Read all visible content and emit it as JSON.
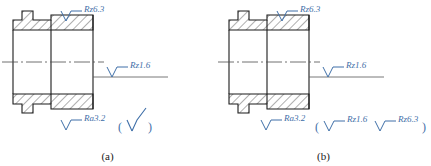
{
  "figures": [
    {
      "caption": "(a)",
      "symbols": {
        "top": "Rz6.3",
        "middle": "Rz1.6",
        "bottom_left": "Ra3.2"
      },
      "paren_group": {
        "open": "(",
        "close": ")",
        "entries": [
          ""
        ]
      }
    },
    {
      "caption": "(b)",
      "symbols": {
        "top": "Rz6.3",
        "middle": "Rz1.6",
        "bottom_left": "Ra3.2"
      },
      "paren_group": {
        "open": "(",
        "close": ")",
        "entries": [
          "Rz1.6",
          "Rz6.3"
        ]
      }
    }
  ],
  "colors": {
    "annotation": "#3f6fa8",
    "outline": "#1a1a1a",
    "hatch": "#1a1a1a",
    "centerline": "#4d4d4d"
  }
}
